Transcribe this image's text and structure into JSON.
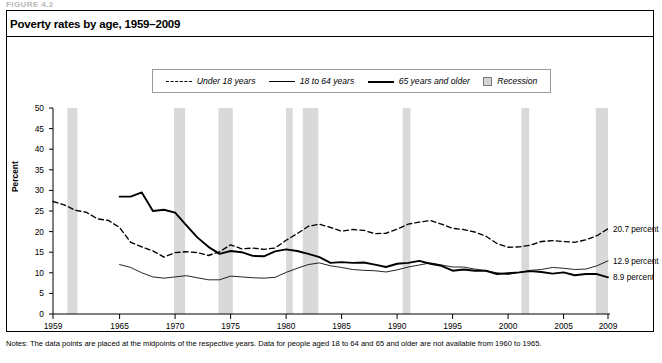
{
  "figure_label": "FIGURE 4.2",
  "title": "Poverty rates by age, 1959–2009",
  "legend": [
    {
      "label": "Under 18 years",
      "style": "dashed"
    },
    {
      "label": "18 to 64 years",
      "style": "thin-solid"
    },
    {
      "label": "65 years and older",
      "style": "thick-solid"
    },
    {
      "label": "Recession",
      "style": "gray-box"
    }
  ],
  "notes": "Notes: The data points are placed at the midpoints of the respective years. Data for people aged 18 to 64 and 65 and older are not available from 1960 to 1965.",
  "end_labels": [
    {
      "text": "20.7 percent",
      "value": 20.7,
      "series": "Under 18 years"
    },
    {
      "text": "12.9 percent",
      "value": 12.9,
      "series": "18 to 64 years"
    },
    {
      "text": "8.9 percent",
      "value": 8.9,
      "series": "65 years and older"
    }
  ],
  "colors": {
    "recession_band": "#d9d9d9",
    "line": "#000000",
    "axis": "#000000",
    "panel_border": "#000000"
  },
  "chart_data": {
    "type": "line",
    "title": "Poverty rates by age, 1959–2009",
    "xlabel": "",
    "ylabel": "Percent",
    "xlim": [
      1959,
      2009
    ],
    "ylim": [
      0,
      50
    ],
    "ytick_step": 5,
    "yticks": [
      0,
      5,
      10,
      15,
      20,
      25,
      30,
      35,
      40,
      45,
      50
    ],
    "xticks": [
      1959,
      1965,
      1970,
      1975,
      1980,
      1985,
      1990,
      1995,
      2000,
      2005,
      2009
    ],
    "grid": false,
    "legend_position": "top-center",
    "x": [
      1959,
      1960,
      1961,
      1962,
      1963,
      1964,
      1965,
      1966,
      1967,
      1968,
      1969,
      1970,
      1971,
      1972,
      1973,
      1974,
      1975,
      1976,
      1977,
      1978,
      1979,
      1980,
      1981,
      1982,
      1983,
      1984,
      1985,
      1986,
      1987,
      1988,
      1989,
      1990,
      1991,
      1992,
      1993,
      1994,
      1995,
      1996,
      1997,
      1998,
      1999,
      2000,
      2001,
      2002,
      2003,
      2004,
      2005,
      2006,
      2007,
      2008,
      2009
    ],
    "series": [
      {
        "name": "Under 18 years",
        "style": "dashed",
        "values": [
          27.3,
          26.5,
          25.2,
          24.7,
          23.1,
          22.7,
          21.0,
          17.4,
          16.3,
          15.3,
          13.8,
          14.9,
          15.1,
          14.9,
          14.2,
          15.1,
          16.8,
          15.8,
          16.0,
          15.7,
          16.0,
          17.9,
          19.5,
          21.3,
          21.8,
          21.0,
          20.1,
          20.5,
          20.3,
          19.5,
          19.6,
          20.6,
          21.8,
          22.3,
          22.7,
          21.8,
          20.8,
          20.5,
          19.9,
          18.9,
          17.1,
          16.2,
          16.3,
          16.7,
          17.6,
          17.8,
          17.6,
          17.4,
          18.0,
          19.0,
          20.7
        ]
      },
      {
        "name": "18 to 64 years",
        "style": "thin-solid",
        "values": [
          17.0,
          null,
          null,
          null,
          null,
          null,
          12.0,
          11.3,
          10.0,
          9.0,
          8.7,
          9.0,
          9.3,
          8.8,
          8.3,
          8.3,
          9.2,
          9.0,
          8.8,
          8.7,
          8.9,
          10.1,
          11.1,
          12.0,
          12.4,
          11.7,
          11.3,
          10.8,
          10.6,
          10.5,
          10.2,
          10.7,
          11.4,
          11.9,
          12.4,
          11.9,
          11.4,
          11.4,
          10.9,
          10.5,
          10.0,
          9.6,
          10.1,
          10.6,
          10.8,
          11.3,
          11.1,
          10.8,
          10.9,
          11.7,
          12.9
        ]
      },
      {
        "name": "65 years and older",
        "style": "thick-solid",
        "values": [
          35.2,
          null,
          null,
          null,
          null,
          null,
          28.5,
          28.5,
          29.5,
          25.0,
          25.3,
          24.6,
          21.6,
          18.6,
          16.3,
          14.6,
          15.3,
          15.0,
          14.1,
          14.0,
          15.2,
          15.7,
          15.3,
          14.6,
          13.8,
          12.4,
          12.6,
          12.4,
          12.5,
          12.0,
          11.4,
          12.2,
          12.4,
          12.9,
          12.2,
          11.7,
          10.5,
          10.8,
          10.5,
          10.5,
          9.7,
          9.9,
          10.1,
          10.4,
          10.2,
          9.8,
          10.1,
          9.4,
          9.7,
          9.7,
          8.9
        ]
      }
    ],
    "recessions": [
      {
        "start": 1960.3,
        "end": 1961.2
      },
      {
        "start": 1969.9,
        "end": 1970.9
      },
      {
        "start": 1973.9,
        "end": 1975.2
      },
      {
        "start": 1980.0,
        "end": 1980.6
      },
      {
        "start": 1981.5,
        "end": 1982.9
      },
      {
        "start": 1990.5,
        "end": 1991.2
      },
      {
        "start": 2001.2,
        "end": 2001.9
      },
      {
        "start": 2007.9,
        "end": 2009.5
      }
    ]
  }
}
